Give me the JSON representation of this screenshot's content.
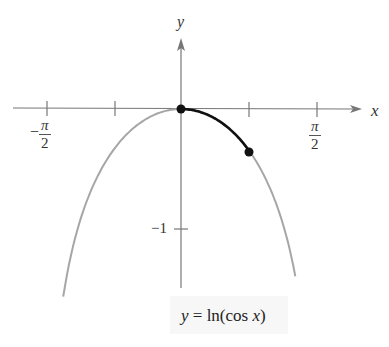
{
  "chart_data": {
    "type": "line",
    "title": "",
    "function": "y = ln(cos x)",
    "xlabel": "x",
    "ylabel": "y",
    "x_ticks": [
      {
        "value": -1.5708,
        "label": "−π/2"
      },
      {
        "value": -0.7854,
        "label": ""
      },
      {
        "value": 0.7854,
        "label": ""
      },
      {
        "value": 1.5708,
        "label": "π/2"
      }
    ],
    "y_ticks": [
      {
        "value": -1,
        "label": "−1"
      }
    ],
    "xlim": [
      -2.09,
      2.1
    ],
    "ylim": [
      -2.1,
      0.82
    ],
    "grid": false,
    "series": [
      {
        "name": "y = ln(cos x)",
        "style": "gray",
        "domain": [
          -1.36,
          1.32
        ],
        "x": [
          -1.36,
          -1.2,
          -1.0,
          -0.8,
          -0.6,
          -0.4,
          -0.2,
          0,
          0.2,
          0.4,
          0.6,
          0.8,
          1.0,
          1.2,
          1.32
        ],
        "values": [
          -1.55,
          -1.02,
          -0.62,
          -0.36,
          -0.19,
          -0.08,
          -0.02,
          0,
          -0.02,
          -0.08,
          -0.19,
          -0.36,
          -0.62,
          -1.02,
          -1.38
        ]
      },
      {
        "name": "highlighted arc",
        "style": "black-bold",
        "domain": [
          0,
          0.7854
        ],
        "x": [
          0,
          0.2,
          0.4,
          0.6,
          0.7854
        ],
        "values": [
          0,
          -0.0203,
          -0.0823,
          -0.1915,
          -0.3466
        ]
      }
    ],
    "points": [
      {
        "x": 0,
        "y": 0
      },
      {
        "x": 0.7854,
        "y": -0.3466
      }
    ]
  },
  "labels": {
    "x_axis": "x",
    "y_axis": "y",
    "neg_pi_over_2": {
      "sign": "−",
      "num": "π",
      "den": "2"
    },
    "pi_over_2": {
      "num": "π",
      "den": "2"
    },
    "y_tick_neg1": "−1",
    "caption_y": "y",
    "caption_eq": " = ln(cos ",
    "caption_x": "x",
    "caption_close": ")"
  },
  "colors": {
    "axis": "#777777",
    "curve": "#a6a6a6",
    "highlight": "#111111"
  }
}
